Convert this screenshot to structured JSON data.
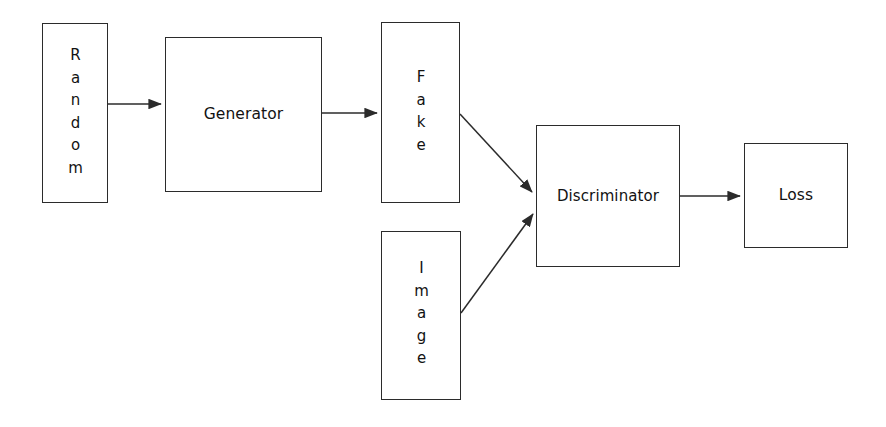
{
  "diagram": {
    "type": "flow-diagram",
    "background_color": "#ffffff",
    "stroke_color": "#2b2b2b",
    "text_color": "#121212",
    "nodes": [
      {
        "id": "random",
        "label": "Random",
        "orientation": "vertical",
        "shape": "rectangle",
        "x": 42,
        "y": 23,
        "width": 66,
        "height": 180
      },
      {
        "id": "generator",
        "label": "Generator",
        "orientation": "horizontal",
        "shape": "rectangle",
        "x": 165,
        "y": 37,
        "width": 157,
        "height": 155
      },
      {
        "id": "fake",
        "label": "Fake",
        "orientation": "vertical",
        "shape": "rectangle",
        "x": 381,
        "y": 22,
        "width": 79,
        "height": 181
      },
      {
        "id": "image",
        "label": "Image",
        "orientation": "vertical",
        "shape": "rectangle",
        "x": 381,
        "y": 231,
        "width": 80,
        "height": 169
      },
      {
        "id": "discriminator",
        "label": "Discriminator",
        "orientation": "horizontal",
        "shape": "rectangle",
        "x": 536,
        "y": 125,
        "width": 144,
        "height": 142
      },
      {
        "id": "loss",
        "label": "Loss",
        "orientation": "horizontal",
        "shape": "rectangle",
        "x": 744,
        "y": 143,
        "width": 104,
        "height": 105
      }
    ],
    "edges": [
      {
        "id": "random-to-generator",
        "from": "random",
        "to": "generator",
        "label": "",
        "style": "straight",
        "x1": 108,
        "y1": 104,
        "x2": 163,
        "y2": 104
      },
      {
        "id": "generator-to-fake",
        "from": "generator",
        "to": "fake",
        "label": "",
        "style": "straight",
        "x1": 322,
        "y1": 113,
        "x2": 379,
        "y2": 113
      },
      {
        "id": "fake-to-discriminator",
        "from": "fake",
        "to": "discriminator",
        "label": "",
        "style": "diagonal",
        "x1": 460,
        "y1": 114,
        "x2": 534,
        "y2": 194
      },
      {
        "id": "image-to-discriminator",
        "from": "image",
        "to": "discriminator",
        "label": "",
        "style": "diagonal",
        "x1": 461,
        "y1": 313,
        "x2": 534,
        "y2": 212
      },
      {
        "id": "discriminator-to-loss",
        "from": "discriminator",
        "to": "loss",
        "label": "",
        "style": "straight",
        "x1": 680,
        "y1": 196,
        "x2": 742,
        "y2": 196
      }
    ]
  }
}
